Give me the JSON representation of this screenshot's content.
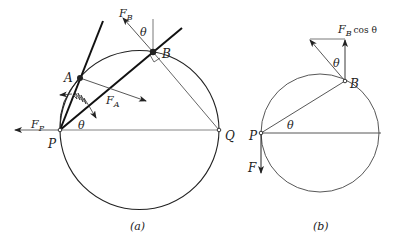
{
  "figure_a": {
    "caption": "(a)",
    "labels": {
      "A": "A",
      "B": "B",
      "P": "P",
      "Q": "Q",
      "theta_P": "θ",
      "theta_B": "θ",
      "F_B_main": "F",
      "F_B_sub": "B",
      "F_A_main": "F",
      "F_A_sub": "A",
      "F_P_main": "F",
      "F_P_sub": "P"
    }
  },
  "figure_b": {
    "caption": "(b)",
    "labels": {
      "B": "B",
      "P": "P",
      "F": "F",
      "theta_P": "θ",
      "theta_B": "θ",
      "FBcos_main": "F",
      "FBcos_sub": "B",
      "FBcos_tail": "cos θ"
    }
  },
  "colors": {
    "line": "#222222",
    "thin_line": "#555555",
    "background": "#ffffff"
  }
}
